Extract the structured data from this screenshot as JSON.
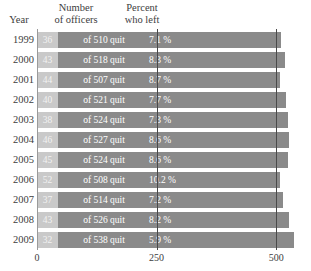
{
  "headers": {
    "year": "Year",
    "number_line1": "Number",
    "number_line2": "of officers",
    "percent_line1": "Percent",
    "percent_line2": "who left"
  },
  "colors": {
    "bar_total": "#8a8a8a",
    "bar_quit": "#c9c9c9",
    "gridline": "#4a4a4a",
    "text": "#3d3d3d",
    "bar_label_text": "#ffffff",
    "background": "#ffffff"
  },
  "chart_data": {
    "type": "bar",
    "title": "",
    "xlabel": "",
    "ylabel": "Year",
    "xlim": [
      0,
      533
    ],
    "xticks": [
      0,
      250,
      500
    ],
    "xticklabels": [
      "0",
      "250",
      "500"
    ],
    "grid": true,
    "legend": "none",
    "orientation": "horizontal",
    "stacked": true,
    "categories": [
      "1999",
      "2000",
      "2001",
      "2002",
      "2003",
      "2004",
      "2005",
      "2006",
      "2007",
      "2008",
      "2009"
    ],
    "series": [
      {
        "name": "Number who quit",
        "values": [
          36,
          43,
          44,
          40,
          38,
          46,
          45,
          52,
          37,
          43,
          32
        ]
      },
      {
        "name": "Total number of officers",
        "values": [
          510,
          518,
          507,
          521,
          524,
          527,
          524,
          508,
          514,
          526,
          538
        ]
      },
      {
        "name": "Percent who left",
        "values": [
          7.1,
          8.3,
          8.7,
          7.7,
          7.3,
          8.6,
          8.6,
          10.2,
          7.2,
          8.2,
          5.9
        ]
      }
    ],
    "rows": [
      {
        "year": "1999",
        "quit": "36",
        "of_total": "of 510 quit",
        "total": 510,
        "percent": "7.1 %"
      },
      {
        "year": "2000",
        "quit": "43",
        "of_total": "of 518 quit",
        "total": 518,
        "percent": "8.3 %"
      },
      {
        "year": "2001",
        "quit": "44",
        "of_total": "of 507 quit",
        "total": 507,
        "percent": "8.7 %"
      },
      {
        "year": "2002",
        "quit": "40",
        "of_total": "of 521 quit",
        "total": 521,
        "percent": "7.7 %"
      },
      {
        "year": "2003",
        "quit": "38",
        "of_total": "of 524 quit",
        "total": 524,
        "percent": "7.3 %"
      },
      {
        "year": "2004",
        "quit": "46",
        "of_total": "of 527 quit",
        "total": 527,
        "percent": "8.6 %"
      },
      {
        "year": "2005",
        "quit": "45",
        "of_total": "of 524 quit",
        "total": 524,
        "percent": "8.6 %"
      },
      {
        "year": "2006",
        "quit": "52",
        "of_total": "of 508 quit",
        "total": 508,
        "percent": "10.2 %"
      },
      {
        "year": "2007",
        "quit": "37",
        "of_total": "of 514 quit",
        "total": 514,
        "percent": "7.2 %"
      },
      {
        "year": "2008",
        "quit": "43",
        "of_total": "of 526 quit",
        "total": 526,
        "percent": "8.2 %"
      },
      {
        "year": "2009",
        "quit": "32",
        "of_total": "of 538 quit",
        "total": 538,
        "percent": "5.9 %"
      }
    ]
  }
}
